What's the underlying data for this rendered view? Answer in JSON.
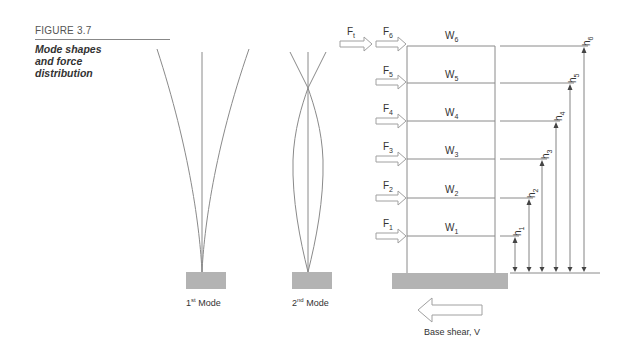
{
  "caption": {
    "figure_number": "FIGURE 3.7",
    "title_lines": [
      "Mode shapes",
      "and force",
      "distribution"
    ]
  },
  "modes": [
    {
      "label_base": "1",
      "label_sup": "st",
      "label_rest": " Mode"
    },
    {
      "label_base": "2",
      "label_sup": "nd",
      "label_rest": " Mode"
    }
  ],
  "frame": {
    "top_force": {
      "base": "F",
      "sub": "t"
    },
    "floors": [
      {
        "force": {
          "base": "F",
          "sub": "6"
        },
        "weight": {
          "base": "W",
          "sub": "6"
        },
        "height": {
          "base": "h",
          "sub": "6"
        }
      },
      {
        "force": {
          "base": "F",
          "sub": "5"
        },
        "weight": {
          "base": "W",
          "sub": "5"
        },
        "height": {
          "base": "h",
          "sub": "5"
        }
      },
      {
        "force": {
          "base": "F",
          "sub": "4"
        },
        "weight": {
          "base": "W",
          "sub": "4"
        },
        "height": {
          "base": "h",
          "sub": "4"
        }
      },
      {
        "force": {
          "base": "F",
          "sub": "3"
        },
        "weight": {
          "base": "W",
          "sub": "3"
        },
        "height": {
          "base": "h",
          "sub": "3"
        }
      },
      {
        "force": {
          "base": "F",
          "sub": "2"
        },
        "weight": {
          "base": "W",
          "sub": "2"
        },
        "height": {
          "base": "h",
          "sub": "2"
        }
      },
      {
        "force": {
          "base": "F",
          "sub": "1"
        },
        "weight": {
          "base": "W",
          "sub": "1"
        },
        "height": {
          "base": "h",
          "sub": "1"
        }
      }
    ],
    "base_shear_label": "Base shear, V"
  },
  "colors": {
    "line": "#8a8a8a",
    "ground": "#b3b3b3",
    "arrow_outline": "#a0a0a0",
    "text": "#333333"
  }
}
